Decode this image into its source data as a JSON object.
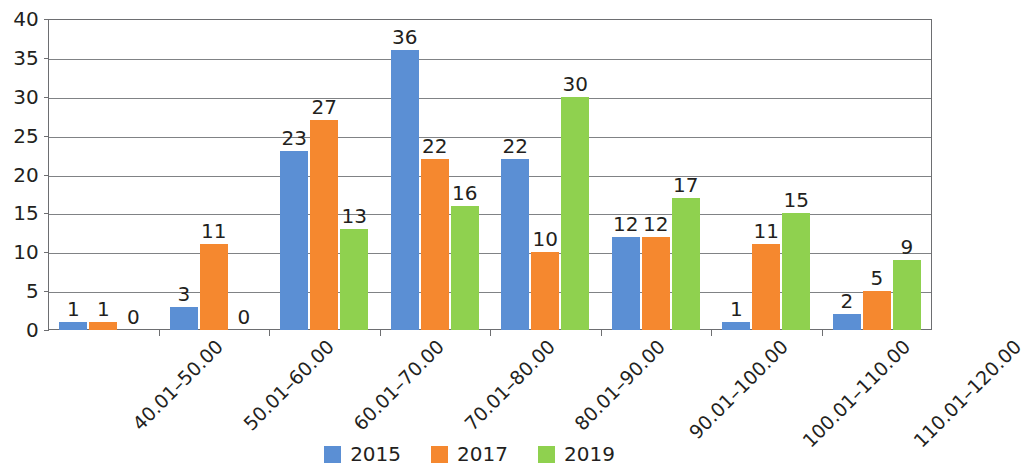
{
  "chart_data": {
    "type": "bar",
    "title": "",
    "subtitle": "",
    "xlabel": "",
    "ylabel": "",
    "ylim": [
      0,
      40
    ],
    "ytick_step": 5,
    "yticks": [
      "0",
      "5",
      "10",
      "15",
      "20",
      "25",
      "30",
      "35",
      "40"
    ],
    "grid": true,
    "legend_position": "bottom-center",
    "categories": [
      "40.01–50.00",
      "50.01–60.00",
      "60.01–70.00",
      "70.01–80.00",
      "80.01–90.00",
      "90.01–100.00",
      "100.01–110.00",
      "110.01–120.00"
    ],
    "series": [
      {
        "name": "2015",
        "color": "#5b8fd4",
        "values": [
          1,
          3,
          23,
          36,
          22,
          12,
          1,
          2
        ]
      },
      {
        "name": "2017",
        "color": "#f5882f",
        "values": [
          1,
          11,
          27,
          22,
          10,
          12,
          11,
          5
        ]
      },
      {
        "name": "2019",
        "color": "#8fd14f",
        "values": [
          0,
          0,
          13,
          16,
          30,
          17,
          15,
          9
        ]
      }
    ],
    "data_labels": [
      [
        "1",
        "1",
        "0"
      ],
      [
        "3",
        "11",
        "0"
      ],
      [
        "23",
        "27",
        "13"
      ],
      [
        "36",
        "22",
        "16"
      ],
      [
        "22",
        "10",
        "30"
      ],
      [
        "12",
        "12",
        "17"
      ],
      [
        "1",
        "11",
        "15"
      ],
      [
        "2",
        "5",
        "9"
      ]
    ]
  },
  "legend": {
    "items": [
      {
        "label": "2015",
        "color": "#5b8fd4"
      },
      {
        "label": "2017",
        "color": "#f5882f"
      },
      {
        "label": "2019",
        "color": "#8fd14f"
      }
    ]
  },
  "colors": {
    "series_2015": "#5b8fd4",
    "series_2017": "#f5882f",
    "series_2019": "#8fd14f",
    "axis": "#6d6e71",
    "gridline": "#808285",
    "text": "#231f20",
    "background": "#ffffff"
  }
}
